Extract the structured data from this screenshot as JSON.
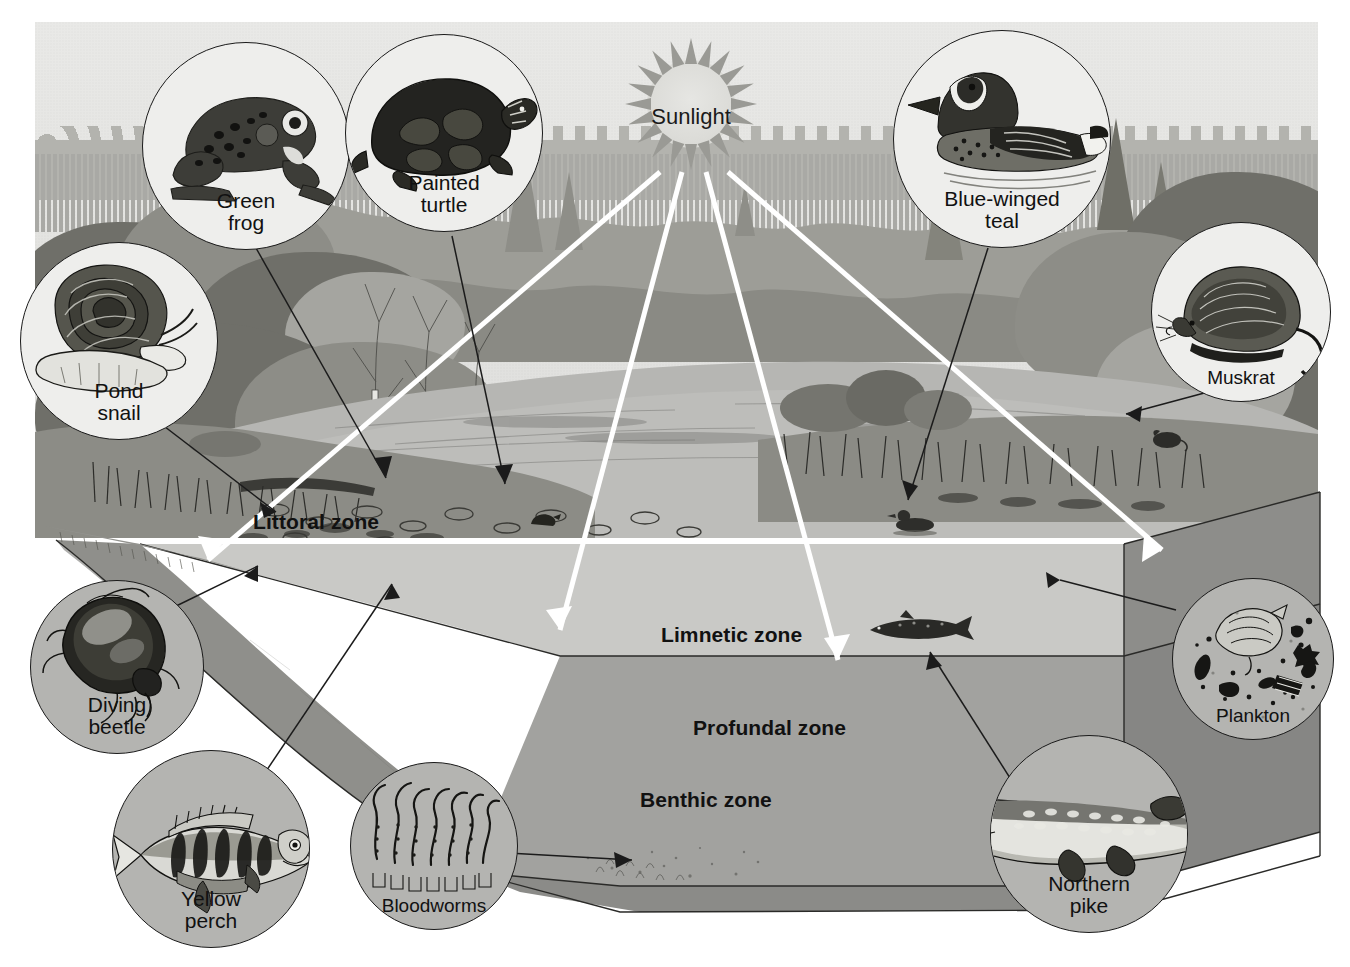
{
  "diagram": {
    "sun": {
      "label": "Sunlight"
    },
    "zones": [
      {
        "id": "littoral",
        "label": "Littoral zone"
      },
      {
        "id": "limnetic",
        "label": "Limnetic zone"
      },
      {
        "id": "profundal",
        "label": "Profundal zone"
      },
      {
        "id": "benthic",
        "label": "Benthic zone"
      }
    ],
    "organisms": [
      {
        "id": "green-frog",
        "label_line1": "Green",
        "label_line2": "frog"
      },
      {
        "id": "painted-turtle",
        "label_line1": "Painted",
        "label_line2": "turtle"
      },
      {
        "id": "pond-snail",
        "label_line1": "Pond",
        "label_line2": "snail"
      },
      {
        "id": "blue-winged-teal",
        "label_line1": "Blue-winged",
        "label_line2": "teal"
      },
      {
        "id": "muskrat",
        "label_line1": "Muskrat",
        "label_line2": ""
      },
      {
        "id": "diving-beetle",
        "label_line1": "Diving",
        "label_line2": "beetle"
      },
      {
        "id": "yellow-perch",
        "label_line1": "Yellow",
        "label_line2": "perch"
      },
      {
        "id": "bloodworms",
        "label_line1": "Bloodworms",
        "label_line2": ""
      },
      {
        "id": "northern-pike",
        "label_line1": "Northern",
        "label_line2": "pike"
      },
      {
        "id": "plankton",
        "label_line1": "Plankton",
        "label_line2": ""
      }
    ],
    "colors": {
      "sky": "#e4e4e1",
      "water_surface": "#b9b9b6",
      "limnetic": "#c7c7c4",
      "profundal": "#a1a19e",
      "benthic": "#9a9a97",
      "side_face": "#8b8b88",
      "sediment": "#8f8f8b",
      "ink": "#1a1a1a",
      "beam": "#ffffff"
    }
  }
}
